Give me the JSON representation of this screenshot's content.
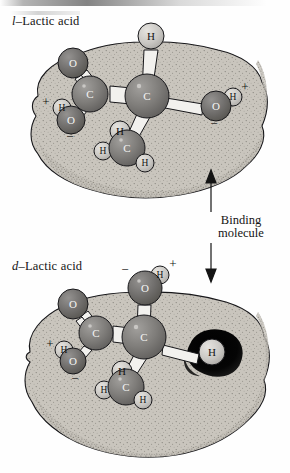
{
  "figure": {
    "title_top": "l–Lactic acid",
    "title_top_prefix": "l",
    "title_top_rest": "–Lactic acid",
    "title_bottom": "d–Lactic acid",
    "title_bottom_prefix": "d",
    "title_bottom_rest": "–Lactic acid",
    "binding_label_line1": "Binding",
    "binding_label_line2": "molecule"
  },
  "colors": {
    "receptor_fill": "#c9c5bd",
    "receptor_stipple": "#8c8880",
    "outline": "#17171a",
    "carbon": "#7b7a78",
    "oxygen": "#6e6c6a",
    "hydrogen": "#c9c7c3",
    "bond": "#f2f1ee",
    "clash_blob": "#0a0a0a",
    "text": "#141414"
  },
  "top_molecule": {
    "name": "l-lactic-acid",
    "atoms": [
      {
        "id": "h-top",
        "label": "H",
        "kind": "hydrogen",
        "cx": 151,
        "cy": 36,
        "r": 13
      },
      {
        "id": "c-alpha",
        "label": "C",
        "kind": "carbon",
        "cx": 147,
        "cy": 96,
        "r": 22
      },
      {
        "id": "c-carboxyl",
        "label": "C",
        "kind": "carbon",
        "cx": 90,
        "cy": 94,
        "r": 18
      },
      {
        "id": "o-double",
        "label": "O",
        "kind": "oxygen",
        "cx": 73,
        "cy": 63,
        "r": 15
      },
      {
        "id": "o-single",
        "label": "O",
        "kind": "oxygen",
        "cx": 71,
        "cy": 120,
        "r": 14
      },
      {
        "id": "h-hydroxyl-left",
        "label": "H",
        "kind": "hydrogen",
        "cx": 62,
        "cy": 108,
        "r": 9
      },
      {
        "id": "o-hydroxyl",
        "label": "O",
        "kind": "oxygen",
        "cx": 216,
        "cy": 106,
        "r": 15
      },
      {
        "id": "h-hydroxyl-right",
        "label": "H",
        "kind": "hydrogen",
        "cx": 233,
        "cy": 97,
        "r": 9
      },
      {
        "id": "c-methyl",
        "label": "C",
        "kind": "carbon",
        "cx": 127,
        "cy": 148,
        "r": 18
      },
      {
        "id": "h-methyl-top",
        "label": "H",
        "kind": "hydrogen",
        "cx": 120,
        "cy": 131,
        "r": 10
      },
      {
        "id": "h-methyl-left",
        "label": "H",
        "kind": "hydrogen",
        "cx": 103,
        "cy": 151,
        "r": 9
      },
      {
        "id": "h-methyl-bottom",
        "label": "H",
        "kind": "hydrogen",
        "cx": 145,
        "cy": 163,
        "r": 9
      }
    ],
    "charges": [
      {
        "sign": "+",
        "x": 46,
        "y": 101
      },
      {
        "sign": "−",
        "x": 70,
        "y": 136
      },
      {
        "sign": "+",
        "x": 245,
        "y": 86
      },
      {
        "sign": "−",
        "x": 214,
        "y": 123
      }
    ]
  },
  "bottom_molecule": {
    "name": "d-lactic-acid",
    "atoms": [
      {
        "id": "o-hydroxyl",
        "label": "O",
        "kind": "oxygen",
        "cx": 145,
        "cy": 288,
        "r": 17
      },
      {
        "id": "h-hydroxyl",
        "label": "H",
        "kind": "hydrogen",
        "cx": 160,
        "cy": 275,
        "r": 9
      },
      {
        "id": "c-alpha",
        "label": "C",
        "kind": "carbon",
        "cx": 144,
        "cy": 337,
        "r": 22
      },
      {
        "id": "c-carboxyl",
        "label": "C",
        "kind": "carbon",
        "cx": 96,
        "cy": 333,
        "r": 17
      },
      {
        "id": "o-double",
        "label": "O",
        "kind": "oxygen",
        "cx": 73,
        "cy": 304,
        "r": 15
      },
      {
        "id": "o-single",
        "label": "O",
        "kind": "oxygen",
        "cx": 73,
        "cy": 361,
        "r": 13
      },
      {
        "id": "h-carboxyl",
        "label": "H",
        "kind": "hydrogen",
        "cx": 64,
        "cy": 350,
        "r": 9
      },
      {
        "id": "h-clash",
        "label": "H",
        "kind": "hydrogen",
        "cx": 212,
        "cy": 352,
        "r": 13
      },
      {
        "id": "c-methyl",
        "label": "C",
        "kind": "carbon",
        "cx": 126,
        "cy": 387,
        "r": 18
      },
      {
        "id": "h-methyl-top",
        "label": "H",
        "kind": "hydrogen",
        "cx": 122,
        "cy": 371,
        "r": 10
      },
      {
        "id": "h-methyl-left",
        "label": "H",
        "kind": "hydrogen",
        "cx": 104,
        "cy": 390,
        "r": 9
      },
      {
        "id": "h-methyl-bottom",
        "label": "H",
        "kind": "hydrogen",
        "cx": 143,
        "cy": 400,
        "r": 9
      }
    ],
    "charges": [
      {
        "sign": "−",
        "x": 125,
        "y": 269
      },
      {
        "sign": "+",
        "x": 173,
        "y": 263
      },
      {
        "sign": "+",
        "x": 50,
        "y": 343
      },
      {
        "sign": "−",
        "x": 75,
        "y": 378
      }
    ]
  }
}
